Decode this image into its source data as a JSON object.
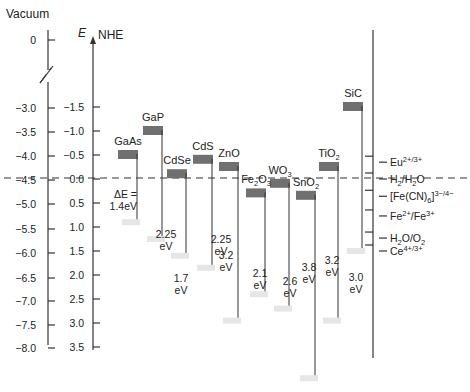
{
  "chart_data": {
    "type": "band-edge-diagram",
    "title": "",
    "axes": {
      "vacuum": {
        "label": "Vacuum",
        "ticks": [
          "0",
          "-3.0",
          "-3.5",
          "-4.0",
          "-4.5",
          "-5.0",
          "-5.5",
          "-6.0",
          "-6.5",
          "-7.0",
          "-7.5",
          "-8.0"
        ],
        "axis_break": true
      },
      "nhe": {
        "label_italic": "E",
        "label": "NHE",
        "ticks": [
          "-1.5",
          "-1.0",
          "-0.5",
          "0.0",
          "0.5",
          "1.0",
          "1.5",
          "2.0",
          "2.5",
          "3.0",
          "3.5"
        ]
      }
    },
    "reference_line": {
      "label": "H2/H2O at 0.0 V NHE (-4.5 eV vacuum)",
      "style": "dashed"
    },
    "semiconductors": [
      {
        "name": "GaAs",
        "cb_nhe": -0.5,
        "bandgap_label": "ΔE = 1.4eV",
        "bandgap": 1.4,
        "vb_nhe": 0.9
      },
      {
        "name": "GaP",
        "cb_nhe": -1.0,
        "bandgap_label": "2.25 eV",
        "bandgap": 2.25,
        "vb_nhe": 1.25
      },
      {
        "name": "CdSe",
        "cb_nhe": -0.1,
        "bandgap_label": "1.7 eV",
        "bandgap": 1.7,
        "vb_nhe": 1.6
      },
      {
        "name": "CdS",
        "cb_nhe": -0.4,
        "bandgap_label": "2.25 eV",
        "bandgap": 2.25,
        "vb_nhe": 1.85
      },
      {
        "name": "ZnO",
        "cb_nhe": -0.25,
        "bandgap_label": "3.2 eV",
        "bandgap": 3.2,
        "vb_nhe": 2.95
      },
      {
        "name": "Fe2O3",
        "cb_nhe": 0.3,
        "bandgap_label": "2.1 eV",
        "bandgap": 2.1,
        "vb_nhe": 2.4
      },
      {
        "name": "WO3",
        "cb_nhe": 0.1,
        "bandgap_label": "2.6 eV",
        "bandgap": 2.6,
        "vb_nhe": 2.7
      },
      {
        "name": "SnO2",
        "cb_nhe": 0.35,
        "bandgap_label": "3.8 eV",
        "bandgap": 3.8,
        "vb_nhe": 4.15
      },
      {
        "name": "TiO2",
        "cb_nhe": -0.25,
        "bandgap_label": "3.2 eV",
        "bandgap": 3.2,
        "vb_nhe": 2.95
      },
      {
        "name": "SiC",
        "cb_nhe": -1.5,
        "bandgap_label": "3.0 eV",
        "bandgap": 3.0,
        "vb_nhe": 1.5
      }
    ],
    "redox_couples": [
      {
        "label": "Eu2+/3+",
        "nhe": -0.35
      },
      {
        "label": "H2/H2O",
        "nhe": 0.0
      },
      {
        "label": "[Fe(CN)6]3-/4-",
        "nhe": 0.36
      },
      {
        "label": "Fe2+/Fe3+",
        "nhe": 0.77
      },
      {
        "label": "H2O/O2",
        "nhe": 1.23
      },
      {
        "label": "Ce4+/3+",
        "nhe": 1.5
      }
    ]
  },
  "labels": {
    "vacuum": "Vacuum",
    "e": "E",
    "nhe": "NHE",
    "delta_e_1": "ΔE =",
    "delta_e_2": "1.4eV",
    "ev": "eV"
  }
}
